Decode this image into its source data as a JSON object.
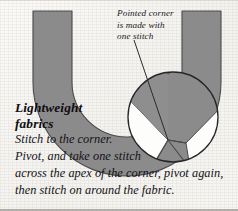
{
  "figure": {
    "title_lines": [
      "Lightweight",
      "fabrics"
    ],
    "callout_lines": [
      "Pointed corner",
      "is made with",
      "one stitch"
    ],
    "body_lines": [
      "Stitch to the corner.",
      "Pivot, and take one stitch",
      "across the apex of the corner, pivot again,",
      "then stitch on around the fabric."
    ],
    "colors": {
      "fabric_gray": "#8b8b8b",
      "fabric_gray_edge": "#4c4c4c",
      "paper": "#f8f7f4",
      "ink": "#17161a",
      "magnifier_fill": "#ffffff",
      "magnifier_stroke": "#2e2e2e",
      "leader_line": "#2b2a2e"
    },
    "shapes": {
      "fabric_band_name": "curved-u-shaped-fabric-band",
      "magnifier_name": "magnified-corner-detail-circle",
      "magnifier_center": [
        173,
        117
      ],
      "magnifier_radius": 45,
      "leader_from": [
        134,
        40
      ],
      "leader_to": [
        168,
        140
      ]
    }
  }
}
